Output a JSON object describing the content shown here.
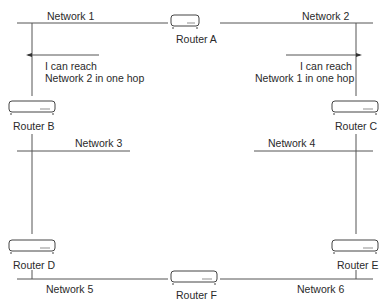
{
  "diagram": {
    "networks": [
      {
        "id": "n1",
        "label": "Network 1"
      },
      {
        "id": "n2",
        "label": "Network 2"
      },
      {
        "id": "n3",
        "label": "Network 3"
      },
      {
        "id": "n4",
        "label": "Network 4"
      },
      {
        "id": "n5",
        "label": "Network 5"
      },
      {
        "id": "n6",
        "label": "Network 6"
      }
    ],
    "routers": [
      {
        "id": "A",
        "label": "Router A"
      },
      {
        "id": "B",
        "label": "Router B"
      },
      {
        "id": "C",
        "label": "Router C"
      },
      {
        "id": "D",
        "label": "Router D"
      },
      {
        "id": "E",
        "label": "Router E"
      },
      {
        "id": "F",
        "label": "Router F"
      }
    ],
    "annotations": {
      "left": {
        "line1": "I can reach",
        "line2": "Network 2 in one hop"
      },
      "right": {
        "line1": "I can reach",
        "line2": "Network 1 in one hop"
      }
    },
    "colors": {
      "line": "#555555",
      "router_stroke": "#444444",
      "router_fill": "#ffffff"
    }
  }
}
